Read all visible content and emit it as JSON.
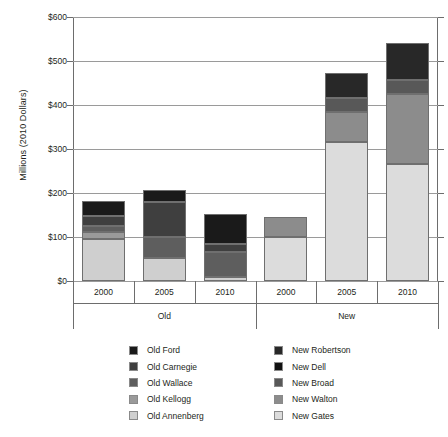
{
  "chart_data": {
    "type": "bar",
    "stacked": true,
    "title": "",
    "xlabel": "",
    "ylabel": "Millions (2010 Dollars)",
    "ylim": [
      0,
      600
    ],
    "yticks": [
      0,
      100,
      200,
      300,
      400,
      500,
      600
    ],
    "ytick_labels": [
      "$0",
      "$100",
      "$200",
      "$300",
      "$400",
      "$500",
      "$600"
    ],
    "grid": true,
    "legend_position": "bottom",
    "categories": [
      "2000",
      "2005",
      "2010",
      "2000",
      "2005",
      "2010"
    ],
    "groups": [
      {
        "label": "Old",
        "categories": [
          "2000",
          "2005",
          "2010"
        ]
      },
      {
        "label": "New",
        "categories": [
          "2000",
          "2005",
          "2010"
        ]
      }
    ],
    "series": [
      {
        "name": "Old Ford",
        "color": "#1a1a1a",
        "values": [
          33,
          27,
          67,
          0,
          0,
          0
        ]
      },
      {
        "name": "Old Carnegie",
        "color": "#3f3f3f",
        "values": [
          22,
          79,
          20,
          0,
          0,
          0
        ]
      },
      {
        "name": "Old Wallace",
        "color": "#5e5e5e",
        "values": [
          14,
          49,
          56,
          0,
          0,
          0
        ]
      },
      {
        "name": "Old Kellogg",
        "color": "#9a9a9a",
        "values": [
          16,
          0,
          0,
          0,
          0,
          0
        ]
      },
      {
        "name": "Old Annenberg",
        "color": "#cfcfcf",
        "values": [
          96,
          52,
          9,
          0,
          0,
          0
        ]
      },
      {
        "name": "New Robertson",
        "color": "#282828",
        "values": [
          0,
          0,
          0,
          0,
          55,
          85
        ]
      },
      {
        "name": "New Dell",
        "color": "#111111",
        "values": [
          0,
          0,
          0,
          0,
          0,
          0
        ]
      },
      {
        "name": "New Broad",
        "color": "#585858",
        "values": [
          0,
          0,
          0,
          0,
          32,
          31
        ]
      },
      {
        "name": "New Walton",
        "color": "#8c8c8c",
        "values": [
          0,
          0,
          0,
          44,
          68,
          161
        ]
      },
      {
        "name": "New Gates",
        "color": "#dcdcdc",
        "values": [
          0,
          0,
          0,
          101,
          317,
          265
        ]
      }
    ],
    "bar_totals": [
      181,
      207,
      152,
      145,
      472,
      542
    ]
  },
  "y_axis": {
    "title": "Millions (2010 Dollars)",
    "ticks": [
      {
        "label": "$600",
        "value": 600
      },
      {
        "label": "$500",
        "value": 500
      },
      {
        "label": "$400",
        "value": 400
      },
      {
        "label": "$300",
        "value": 300
      },
      {
        "label": "$200",
        "value": 200
      },
      {
        "label": "$100",
        "value": 100
      },
      {
        "label": "$0",
        "value": 0
      }
    ]
  },
  "x_axis": {
    "categories": [
      {
        "label": "2000"
      },
      {
        "label": "2005"
      },
      {
        "label": "2010"
      },
      {
        "label": "2000"
      },
      {
        "label": "2005"
      },
      {
        "label": "2010"
      }
    ],
    "groups": [
      {
        "label": "Old"
      },
      {
        "label": "New"
      }
    ]
  },
  "legend": {
    "left_column": [
      {
        "label": "Old Ford",
        "color": "#1a1a1a"
      },
      {
        "label": "Old Carnegie",
        "color": "#3f3f3f"
      },
      {
        "label": "Old Wallace",
        "color": "#5e5e5e"
      },
      {
        "label": "Old Kellogg",
        "color": "#9a9a9a"
      },
      {
        "label": "Old Annenberg",
        "color": "#cfcfcf"
      }
    ],
    "right_column": [
      {
        "label": "New Robertson",
        "color": "#282828"
      },
      {
        "label": "New Dell",
        "color": "#111111"
      },
      {
        "label": "New Broad",
        "color": "#585858"
      },
      {
        "label": "New Walton",
        "color": "#8c8c8c"
      },
      {
        "label": "New Gates",
        "color": "#dcdcdc"
      }
    ]
  }
}
